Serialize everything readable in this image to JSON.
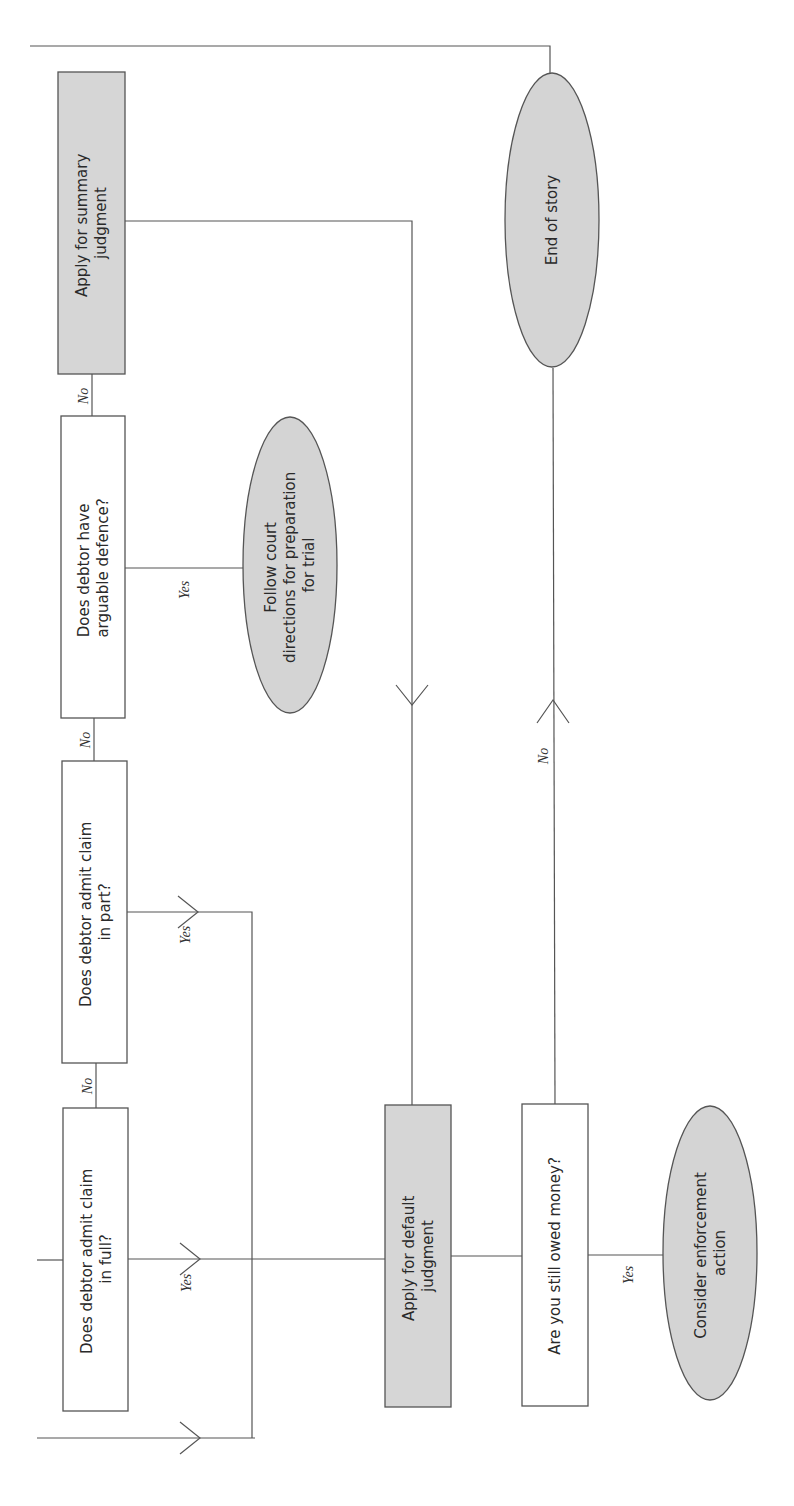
{
  "diagram": {
    "orientation": "rotated-90-ccw",
    "nodes": {
      "admit_full": {
        "type": "decision",
        "lines": [
          "Does debtor admit claim",
          "in full?"
        ]
      },
      "admit_part": {
        "type": "decision",
        "lines": [
          "Does debtor admit claim",
          "in part?"
        ]
      },
      "arguable_defence": {
        "type": "decision",
        "lines": [
          "Does debtor have",
          "arguable defence?"
        ]
      },
      "summary_judgment": {
        "type": "action",
        "lines": [
          "Apply for summary",
          "judgment"
        ]
      },
      "follow_court": {
        "type": "terminal",
        "lines": [
          "Follow court",
          "directions for preparation",
          "for trial"
        ]
      },
      "default_judgment": {
        "type": "action",
        "lines": [
          "Apply for default",
          "judgment"
        ]
      },
      "still_owed": {
        "type": "decision",
        "lines": [
          "Are you still owed money?"
        ]
      },
      "end_of_story": {
        "type": "terminal",
        "lines": [
          "End of story"
        ]
      },
      "enforcement": {
        "type": "terminal",
        "lines": [
          "Consider enforcement",
          "action"
        ]
      }
    },
    "edge_labels": {
      "full_no": "No",
      "full_yes": "Yes",
      "part_no": "No",
      "part_yes": "Yes",
      "defence_no": "No",
      "defence_yes": "Yes",
      "owed_no": "No",
      "owed_yes": "Yes"
    },
    "colors": {
      "action_fill": "#d6d6d6",
      "terminal_fill": "#d4d4d4",
      "decision_fill": "#ffffff",
      "stroke": "#555555"
    }
  }
}
